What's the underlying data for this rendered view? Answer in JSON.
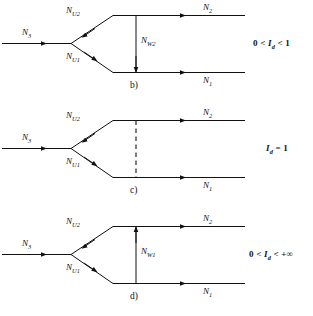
{
  "figure": {
    "type": "diagram",
    "stroke_color": "#111111",
    "background": "#ffffff"
  },
  "panels": [
    {
      "id": "b",
      "panel_label": "b)",
      "incoming_label": "N",
      "incoming_sub": "3",
      "branch_upper_label": "N",
      "branch_upper_sub": "U2",
      "branch_lower_label": "N",
      "branch_lower_sub": "U1",
      "outgoing_upper_label": "N",
      "outgoing_upper_sub": "2",
      "outgoing_lower_label": "N",
      "outgoing_lower_sub": "1",
      "exchange_label": "N",
      "exchange_sub": "W2",
      "exchange_style": "solid",
      "exchange_direction": "down",
      "condition": "0 < I_d < 1",
      "condition_parts": {
        "left": "0 <",
        "symbol": "I",
        "symbol_sub": "d",
        "right": "< 1"
      }
    },
    {
      "id": "c",
      "panel_label": "c)",
      "incoming_label": "N",
      "incoming_sub": "3",
      "branch_upper_label": "N",
      "branch_upper_sub": "U2",
      "branch_lower_label": "N",
      "branch_lower_sub": "U1",
      "outgoing_upper_label": "N",
      "outgoing_upper_sub": "2",
      "outgoing_lower_label": "N",
      "outgoing_lower_sub": "1",
      "exchange_label": "",
      "exchange_sub": "",
      "exchange_style": "dashed",
      "exchange_direction": "none",
      "condition": "I_d = 1",
      "condition_parts": {
        "left": "",
        "symbol": "I",
        "symbol_sub": "d",
        "right": "= 1"
      }
    },
    {
      "id": "d",
      "panel_label": "d)",
      "incoming_label": "N",
      "incoming_sub": "3",
      "branch_upper_label": "N",
      "branch_upper_sub": "U2",
      "branch_lower_label": "N",
      "branch_lower_sub": "U1",
      "outgoing_upper_label": "N",
      "outgoing_upper_sub": "2",
      "outgoing_lower_label": "N",
      "outgoing_lower_sub": "1",
      "exchange_label": "N",
      "exchange_sub": "W1",
      "exchange_style": "solid",
      "exchange_direction": "up",
      "condition": "0 < I_d < +∞",
      "condition_parts": {
        "left": "0 <",
        "symbol": "I",
        "symbol_sub": "d",
        "right": "< +∞"
      }
    }
  ]
}
